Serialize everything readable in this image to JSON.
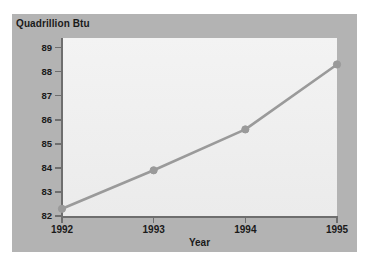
{
  "chart_data": {
    "type": "line",
    "title": "Quadrillion Btu",
    "xlabel": "Year",
    "ylabel": "Quadrillion Btu",
    "categories": [
      "1992",
      "1993",
      "1994",
      "1995"
    ],
    "x": [
      1992,
      1993,
      1994,
      1995
    ],
    "values": [
      82.3,
      83.9,
      85.6,
      88.3
    ],
    "series": [
      {
        "name": "Quadrillion Btu",
        "values": [
          82.3,
          83.9,
          85.6,
          88.3
        ]
      }
    ],
    "ylim": [
      82,
      89.4
    ],
    "xlim": [
      1992,
      1995
    ],
    "yticks": [
      "82",
      "83",
      "84",
      "85",
      "86",
      "87",
      "88",
      "89"
    ],
    "ytick_values": [
      82,
      83,
      84,
      85,
      86,
      87,
      88,
      89
    ],
    "xticks": [
      "1992",
      "1993",
      "1994",
      "1995"
    ],
    "grid": false,
    "legend": "none",
    "marker": "circle",
    "line_color": "#9a9a9a",
    "marker_color": "#9a9a9a",
    "plot_background": "#f0f0f0",
    "panel_background": "#b3b3b3",
    "axis_color": "#6e6e6e",
    "text_color": "#1a1a1a"
  }
}
